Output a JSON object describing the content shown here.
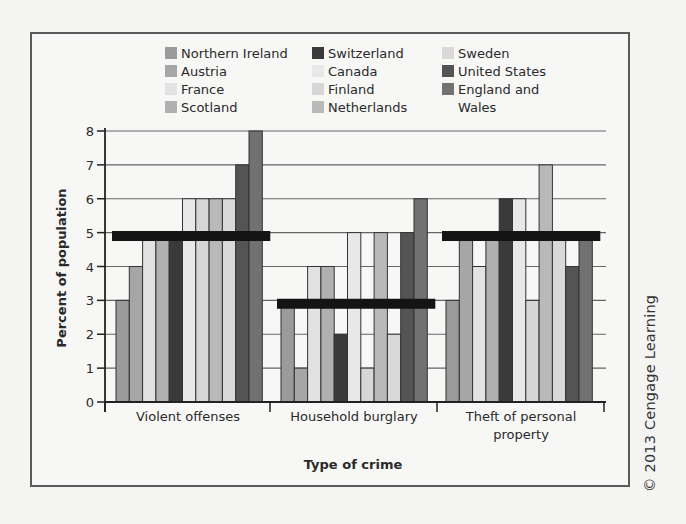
{
  "chart_data": {
    "type": "bar",
    "title": "",
    "xlabel": "Type of crime",
    "ylabel": "Percent of population",
    "ylim": [
      0,
      8
    ],
    "yticks": [
      0,
      1,
      2,
      3,
      4,
      5,
      6,
      7,
      8
    ],
    "grid": true,
    "legend_position": "top",
    "categories": [
      "Violent offenses",
      "Household  burglary",
      "Theft of personal property"
    ],
    "category_label_lines": [
      [
        "Violent offenses"
      ],
      [
        "Household  burglary"
      ],
      [
        "Theft of personal",
        "property"
      ]
    ],
    "series": [
      {
        "name": "Northern Ireland",
        "color": "#9b9b9b",
        "values": [
          3,
          3,
          3
        ]
      },
      {
        "name": "Austria",
        "color": "#a6a6a6",
        "values": [
          4,
          1,
          5
        ]
      },
      {
        "name": "France",
        "color": "#e2e2e2",
        "values": [
          5,
          4,
          4
        ]
      },
      {
        "name": "Scotland",
        "color": "#b0b0b0",
        "values": [
          5,
          4,
          5
        ]
      },
      {
        "name": "Switzerland",
        "color": "#3a3a3a",
        "values": [
          5,
          2,
          6
        ]
      },
      {
        "name": "Canada",
        "color": "#e8e8e8",
        "values": [
          6,
          5,
          6
        ]
      },
      {
        "name": "Finland",
        "color": "#d6d6d6",
        "values": [
          6,
          1,
          3
        ]
      },
      {
        "name": "Netherlands",
        "color": "#b9b9b9",
        "values": [
          6,
          5,
          7
        ]
      },
      {
        "name": "Sweden",
        "color": "#d9d9d9",
        "values": [
          6,
          2,
          5
        ]
      },
      {
        "name": "United States",
        "color": "#545454",
        "values": [
          7,
          5,
          4
        ]
      },
      {
        "name": "England and Wales",
        "color": "#717171",
        "values": [
          8,
          6,
          5
        ]
      }
    ],
    "average_lines": [
      {
        "category": "Violent offenses",
        "value": 4.9
      },
      {
        "category": "Household  burglary",
        "value": 2.9
      },
      {
        "category": "Theft of personal property",
        "value": 4.9
      }
    ]
  },
  "legend": {
    "columns": [
      [
        "Northern Ireland",
        "Austria",
        "France",
        "Scotland"
      ],
      [
        "Switzerland",
        "Canada",
        "Finland",
        "Netherlands"
      ],
      [
        "Sweden",
        "United States",
        "England and",
        "Wales"
      ]
    ]
  },
  "credit": "© 2013 Cengage Learning"
}
